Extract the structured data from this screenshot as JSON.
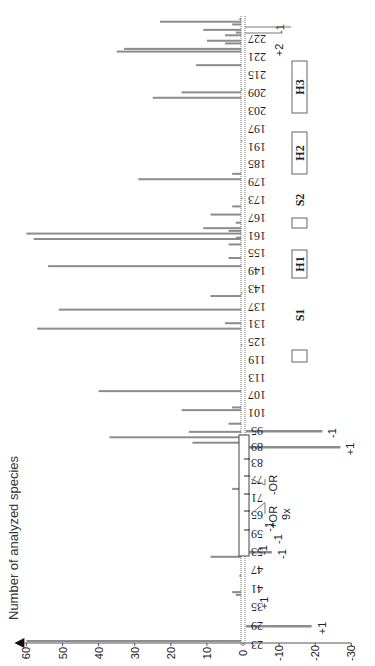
{
  "chart_data": {
    "type": "bar",
    "orientation": "rotated-90-clockwise",
    "ylabel": "Number of analyzed species",
    "ylim": [
      -30,
      60
    ],
    "yticks": [
      60,
      50,
      40,
      30,
      20,
      10,
      0,
      -10,
      -20,
      -30
    ],
    "xticks": [
      23,
      29,
      35,
      41,
      47,
      53,
      59,
      65,
      71,
      77,
      83,
      89,
      95,
      101,
      107,
      113,
      119,
      125,
      131,
      137,
      143,
      149,
      155,
      161,
      167,
      173,
      179,
      185,
      191,
      197,
      203,
      209,
      215,
      221,
      227
    ],
    "series": [
      {
        "name": "positive",
        "color": "#8c8c8c",
        "points": [
          {
            "x": 23,
            "value": 60
          },
          {
            "x": 40,
            "value": 2
          },
          {
            "x": 41,
            "value": 3
          },
          {
            "x": 47,
            "value": 1
          },
          {
            "x": 54,
            "value": 9
          },
          {
            "x": 73,
            "value": 1
          },
          {
            "x": 79,
            "value": 3
          },
          {
            "x": 96,
            "value": 14
          },
          {
            "x": 98,
            "value": 37
          },
          {
            "x": 100,
            "value": 15
          },
          {
            "x": 103,
            "value": 4
          },
          {
            "x": 108,
            "value": 17
          },
          {
            "x": 109,
            "value": 3
          },
          {
            "x": 115,
            "value": 40
          },
          {
            "x": 132,
            "value": 0.5
          },
          {
            "x": 138,
            "value": 57
          },
          {
            "x": 140,
            "value": 5
          },
          {
            "x": 145,
            "value": 51
          },
          {
            "x": 150,
            "value": 9
          },
          {
            "x": 151,
            "value": 0.5
          },
          {
            "x": 161,
            "value": 54
          },
          {
            "x": 164,
            "value": 4
          },
          {
            "x": 169,
            "value": 4
          },
          {
            "x": 171,
            "value": 58
          },
          {
            "x": 171.5,
            "value": 2
          },
          {
            "x": 173,
            "value": 60
          },
          {
            "x": 174,
            "value": 4
          },
          {
            "x": 175,
            "value": 11
          },
          {
            "x": 177,
            "value": 2
          },
          {
            "x": 180,
            "value": 9
          },
          {
            "x": 183,
            "value": 3
          },
          {
            "x": 186,
            "value": 0.5
          },
          {
            "x": 193,
            "value": 29
          },
          {
            "x": 195,
            "value": 3
          },
          {
            "x": 207,
            "value": 0.5
          },
          {
            "x": 223,
            "value": 25
          },
          {
            "x": 225,
            "value": 17
          },
          {
            "x": 226,
            "value": 0.5
          },
          {
            "x": 235,
            "value": 13
          },
          {
            "x": 240,
            "value": 35
          },
          {
            "x": 241,
            "value": 33
          },
          {
            "x": 243,
            "value": 5
          },
          {
            "x": 244,
            "value": 10
          },
          {
            "x": 246,
            "value": 5
          },
          {
            "x": 247,
            "value": 2
          },
          {
            "x": 248,
            "value": 11
          },
          {
            "x": 250,
            "value": 3
          },
          {
            "x": 251,
            "value": 23
          },
          {
            "x": 252,
            "value": 1
          }
        ]
      },
      {
        "name": "negative",
        "color": "#8c8c8c",
        "points": [
          {
            "x": 29,
            "value": -19,
            "annotation": "+1"
          },
          {
            "x": 53,
            "value": -8,
            "annotation": "-1"
          },
          {
            "x": 89,
            "value": -27,
            "annotation": "+1"
          },
          {
            "x": 95,
            "value": -22,
            "annotation": "-1"
          }
        ]
      }
    ],
    "annotations": [
      {
        "text": "+1",
        "near": 35
      },
      {
        "text": "-1",
        "near": 53
      },
      {
        "text": "-1",
        "near": 56
      },
      {
        "text": "-1",
        "near": 60
      },
      {
        "text": "+OR",
        "near": 65
      },
      {
        "text": "9x",
        "near": 65
      },
      {
        "text": "-OR",
        "near": 77
      },
      {
        "text": "+2",
        "near": 221
      },
      {
        "text": "-1",
        "near": 227
      }
    ],
    "regions": [
      {
        "label": "S1",
        "from": 131,
        "to": 134
      },
      {
        "label": "H1",
        "from": 147,
        "to": 154
      },
      {
        "label": "S2",
        "from": 160,
        "to": 163
      },
      {
        "label": "H2",
        "from": 182,
        "to": 192
      },
      {
        "label": "H3",
        "from": 208,
        "to": 220
      }
    ]
  }
}
